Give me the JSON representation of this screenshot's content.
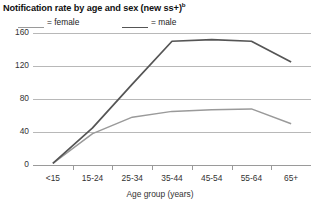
{
  "chart_data": {
    "type": "line",
    "title": "Notification rate by age and sex (new ss+)",
    "title_superscript": "b",
    "xlabel": "Age group (years)",
    "ylabel": "",
    "categories": [
      "<15",
      "15-24",
      "25-34",
      "35-44",
      "45-54",
      "55-64",
      "65+"
    ],
    "ylim": [
      0,
      160
    ],
    "yticks": [
      0,
      40,
      80,
      120,
      160
    ],
    "ytick_labels": [
      "0",
      "40",
      "80",
      "120",
      "160"
    ],
    "grid": true,
    "legend_position": "top-left",
    "series": [
      {
        "name": "female",
        "label": "= female",
        "color": "#9a9a9a",
        "values": [
          2,
          38,
          58,
          65,
          67,
          68,
          50
        ]
      },
      {
        "name": "male",
        "label": "= male",
        "color": "#555555",
        "values": [
          2,
          45,
          98,
          150,
          152,
          150,
          125
        ]
      }
    ]
  },
  "legend": {
    "items": [
      {
        "label": "= female",
        "color": "#9a9a9a"
      },
      {
        "label": "= male",
        "color": "#555555"
      }
    ]
  },
  "axis": {
    "x_title": "Age group (years)"
  }
}
